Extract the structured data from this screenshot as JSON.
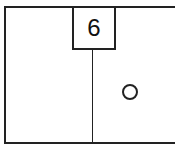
{
  "diagram": {
    "label": "6",
    "symbol": "circle",
    "colors": {
      "stroke": "#222222",
      "background": "#ffffff"
    }
  }
}
